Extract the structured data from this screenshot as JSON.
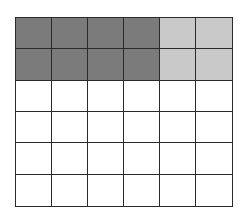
{
  "diagram": {
    "type": "fraction-grid",
    "rows": 6,
    "cols": 6,
    "colors": {
      "dark": "#7b7b7b",
      "light": "#c9c9c9",
      "empty": "#ffffff",
      "line": "#2a2a2a"
    },
    "cells": [
      [
        "dark",
        "dark",
        "dark",
        "dark",
        "light",
        "light"
      ],
      [
        "dark",
        "dark",
        "dark",
        "dark",
        "light",
        "light"
      ],
      [
        "empty",
        "empty",
        "empty",
        "empty",
        "empty",
        "empty"
      ],
      [
        "empty",
        "empty",
        "empty",
        "empty",
        "empty",
        "empty"
      ],
      [
        "empty",
        "empty",
        "empty",
        "empty",
        "empty",
        "empty"
      ],
      [
        "empty",
        "empty",
        "empty",
        "empty",
        "empty",
        "empty"
      ]
    ],
    "counts": {
      "dark": 8,
      "light": 4,
      "empty": 24,
      "total": 36
    }
  }
}
